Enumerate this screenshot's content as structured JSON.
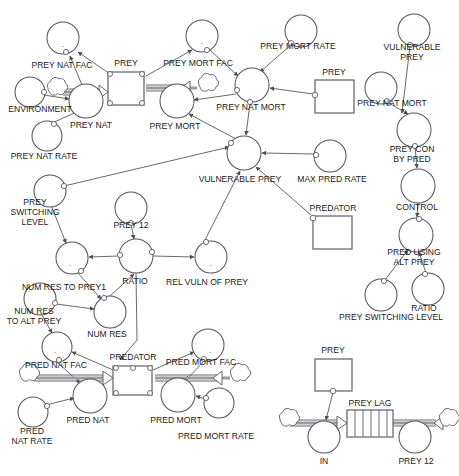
{
  "diagram": {
    "type": "system-dynamics-stock-and-flow",
    "background_color": "#ffffff",
    "line_color": "#55555c",
    "pipe_color": "#9a9aa2",
    "text_color": "#1a1a1a"
  },
  "stocks": [
    {
      "id": "prey",
      "label": "PREY",
      "x": 108,
      "y": 72,
      "w": 36,
      "h": 33
    },
    {
      "id": "prey_ghost",
      "label": "PREY",
      "x": 315,
      "y": 80,
      "w": 39,
      "h": 33
    },
    {
      "id": "predator",
      "label": "PREDATOR",
      "x": 113,
      "y": 366,
      "w": 39,
      "h": 29
    },
    {
      "id": "predator_g",
      "label": "PREDATOR",
      "x": 313,
      "y": 216,
      "w": 39,
      "h": 33
    },
    {
      "id": "prey_low",
      "label": "PREY",
      "x": 315,
      "y": 359,
      "w": 37,
      "h": 32
    }
  ],
  "conveyors": [
    {
      "id": "prey_lag",
      "label": "PREY LAG",
      "x": 347,
      "y": 413,
      "w": 46,
      "h": 27,
      "slats": 5
    }
  ],
  "converters": [
    {
      "id": "prey_nat_fac",
      "label": "PREY NAT FAC",
      "cx": 63,
      "cy": 38,
      "r": 16,
      "sign": "-",
      "label_x": 62,
      "label_y": 66
    },
    {
      "id": "environment",
      "label": "ENVIRONMENT",
      "cx": 30,
      "cy": 92,
      "r": 15,
      "sign": "",
      "label_x": 40,
      "label_y": 110
    },
    {
      "id": "prey_nat",
      "label": "PREY NAT",
      "cx": 86,
      "cy": 101,
      "r": 17,
      "sign": "",
      "label_x": 91,
      "label_y": 126
    },
    {
      "id": "prey_nat_rate",
      "label": "PREY NAT RATE",
      "cx": 47,
      "cy": 136,
      "r": 15,
      "sign": "",
      "label_x": 44,
      "label_y": 157
    },
    {
      "id": "prey_mort_fac",
      "label": "PREY MORT FAC",
      "cx": 202,
      "cy": 36,
      "r": 16,
      "sign": "-",
      "label_x": 198,
      "label_y": 64
    },
    {
      "id": "prey_mort_rate",
      "label": "PREY MORT RATE",
      "cx": 301,
      "cy": 31,
      "r": 16,
      "sign": "",
      "label_x": 298,
      "label_y": 47
    },
    {
      "id": "prey_mort",
      "label": "PREY MORT",
      "cx": 177,
      "cy": 101,
      "r": 17,
      "sign": "",
      "label_x": 175,
      "label_y": 127
    },
    {
      "id": "prey_nat_mort",
      "label": "PREY NAT MORT",
      "cx": 252,
      "cy": 85,
      "r": 17,
      "sign": "",
      "label_x": 251,
      "label_y": 108
    },
    {
      "id": "vulnerable_prey",
      "label": "VULNERABLE PREY",
      "cx": 244,
      "cy": 153,
      "r": 17,
      "sign": "",
      "label_x": 240,
      "label_y": 180
    },
    {
      "id": "max_pred_rate",
      "label": "MAX PRED RATE",
      "cx": 330,
      "cy": 156,
      "r": 16,
      "sign": "",
      "label_x": 332,
      "label_y": 180
    },
    {
      "id": "vulnerable_prey_g",
      "label": "VULNERABLE PREY",
      "cx": 414,
      "cy": 30,
      "r": 16,
      "sign": "",
      "label_x": 410,
      "label_y": 52
    },
    {
      "id": "prey_nat_mort_g",
      "label": "PREY NAT MORT",
      "cx": 381,
      "cy": 88,
      "r": 16,
      "sign": "",
      "label_x": 392,
      "label_y": 104
    },
    {
      "id": "prey_con_by_pred",
      "label": "PREY CON BY PRED",
      "cx": 414,
      "cy": 130,
      "r": 17,
      "sign": "",
      "label_x": 412,
      "label_y": 152
    },
    {
      "id": "control",
      "label": "CONTROL",
      "cx": 418,
      "cy": 186,
      "r": 17,
      "sign": "",
      "label_x": 417,
      "label_y": 208
    },
    {
      "id": "pred_using_alt",
      "label": "PRED USING ALT PREY",
      "cx": 416,
      "cy": 235,
      "r": 17,
      "sign": "",
      "label_x": 414,
      "label_y": 257
    },
    {
      "id": "ratio_r",
      "label": "RATIO",
      "cx": 428,
      "cy": 289,
      "r": 16,
      "sign": "",
      "label_x": 422,
      "label_y": 309
    },
    {
      "id": "prey_switch_r",
      "label": "PREY SWITCHING LEVEL",
      "cx": 381,
      "cy": 295,
      "r": 16,
      "sign": "",
      "label_x": 393,
      "label_y": 318
    },
    {
      "id": "prey_switch_l",
      "label": "PREY SWITCHING LEVEL",
      "cx": 50,
      "cy": 191,
      "r": 16,
      "sign": "",
      "label_x": 35,
      "label_y": 219
    },
    {
      "id": "prey_12",
      "label": "PREY 12",
      "cx": 131,
      "cy": 208,
      "r": 16,
      "sign": "",
      "label_x": 131,
      "label_y": 226
    },
    {
      "id": "ratio_c",
      "label": "RATIO",
      "cx": 136,
      "cy": 256,
      "r": 17,
      "sign": "",
      "label_x": 135,
      "label_y": 282
    },
    {
      "id": "num_res_to_prey1",
      "label": "NUM RES TO PREY1",
      "cx": 72,
      "cy": 258,
      "r": 16,
      "sign": "-",
      "label_x": 64,
      "label_y": 288
    },
    {
      "id": "rel_vuln_of_prey",
      "label": "REL VULN OF PREY",
      "cx": 211,
      "cy": 257,
      "r": 16,
      "sign": "-",
      "label_x": 207,
      "label_y": 283
    },
    {
      "id": "num_res_to_alt",
      "label": "NUM RES TO ALT PREY",
      "cx": 40,
      "cy": 299,
      "r": 16,
      "sign": "-",
      "label_x": 34,
      "label_y": 320
    },
    {
      "id": "num_res",
      "label": "NUM RES",
      "cx": 110,
      "cy": 312,
      "r": 16,
      "sign": "",
      "label_x": 107,
      "label_y": 335
    },
    {
      "id": "pred_nat_fac",
      "label": "PRED NAT FAC",
      "cx": 57,
      "cy": 347,
      "r": 15,
      "sign": "-",
      "label_x": 56,
      "label_y": 366
    },
    {
      "id": "pred_nat",
      "label": "PRED NAT",
      "cx": 90,
      "cy": 396,
      "r": 17,
      "sign": "",
      "label_x": 88,
      "label_y": 421
    },
    {
      "id": "pred_nat_rate",
      "label": "PRED NAT RATE",
      "cx": 33,
      "cy": 412,
      "r": 15,
      "sign": "",
      "label_x": 32,
      "label_y": 437
    },
    {
      "id": "pred_mort_fac",
      "label": "PRED MORT FAC",
      "cx": 208,
      "cy": 345,
      "r": 16,
      "sign": "-",
      "label_x": 200,
      "label_y": 363
    },
    {
      "id": "pred_mort",
      "label": "PRED MORT",
      "cx": 178,
      "cy": 395,
      "r": 17,
      "sign": "",
      "label_x": 176,
      "label_y": 421
    },
    {
      "id": "pred_mort_rate",
      "label": "PRED MORT RATE",
      "cx": 219,
      "cy": 403,
      "r": 15,
      "sign": "",
      "label_x": 215,
      "label_y": 437
    },
    {
      "id": "in_flow",
      "label": "IN",
      "cx": 324,
      "cy": 437,
      "r": 16,
      "sign": "",
      "label_x": 324,
      "label_y": 462
    },
    {
      "id": "prey_12_low",
      "label": "PREY 12",
      "cx": 415,
      "cy": 437,
      "r": 16,
      "sign": "",
      "label_x": 416,
      "label_y": 462
    }
  ],
  "labels": [
    {
      "id": "lbl-prey-top",
      "text": "PREY",
      "x": 126,
      "y": 64
    },
    {
      "id": "lbl-prey-ghost",
      "text": "PREY",
      "x": 334,
      "y": 73
    },
    {
      "id": "lbl-predator-top",
      "text": "PREDATOR",
      "x": 133,
      "y": 358
    },
    {
      "id": "lbl-predator-mid",
      "text": "PREDATOR",
      "x": 333,
      "y": 209
    },
    {
      "id": "lbl-prey-low",
      "text": "PREY",
      "x": 333,
      "y": 351
    },
    {
      "id": "lbl-prey-lag",
      "text": "PREY LAG",
      "x": 370,
      "y": 404
    }
  ],
  "flows": [
    {
      "id": "prey-nat-flow",
      "label": "PREY NAT",
      "from": "cloud",
      "to": "prey"
    },
    {
      "id": "prey-mort-flow",
      "label": "PREY MORT",
      "from": "prey",
      "to": "cloud"
    },
    {
      "id": "pred-nat-flow",
      "label": "PRED NAT",
      "from": "cloud",
      "to": "predator"
    },
    {
      "id": "pred-mort-flow",
      "label": "PRED MORT",
      "from": "predator",
      "to": "cloud"
    },
    {
      "id": "in-flow",
      "label": "IN",
      "from": "cloud",
      "to": "prey_lag"
    },
    {
      "id": "prey12-flow",
      "label": "PREY 12",
      "from": "prey_lag",
      "to": "cloud"
    }
  ],
  "connectors": [
    {
      "from": "prey_nat",
      "to": "prey_nat_fac"
    },
    {
      "from": "prey",
      "to": "prey_nat_fac"
    },
    {
      "from": "environment",
      "to": "prey_nat"
    },
    {
      "from": "prey_nat_rate",
      "to": "prey_nat"
    },
    {
      "from": "prey",
      "to": "prey_mort_fac"
    },
    {
      "from": "prey_mort_fac",
      "to": "prey_nat_mort"
    },
    {
      "from": "prey_mort_rate",
      "to": "prey_nat_mort"
    },
    {
      "from": "prey",
      "to": "prey_nat_mort"
    },
    {
      "from": "prey_nat_mort",
      "to": "prey_mort"
    },
    {
      "from": "prey_nat_mort",
      "to": "vulnerable_prey"
    },
    {
      "from": "vulnerable_prey",
      "to": "prey_mort"
    },
    {
      "from": "max_pred_rate",
      "to": "vulnerable_prey"
    },
    {
      "from": "predator_g",
      "to": "vulnerable_prey"
    },
    {
      "from": "rel_vuln_of_prey",
      "to": "vulnerable_prey"
    },
    {
      "from": "prey_switch_l",
      "to": "vulnerable_prey"
    },
    {
      "from": "ratio_c",
      "to": "rel_vuln_of_prey"
    },
    {
      "from": "ratio_c",
      "to": "num_res_to_prey1"
    },
    {
      "from": "prey_12",
      "to": "ratio_c"
    },
    {
      "from": "num_res",
      "to": "ratio_c"
    },
    {
      "from": "prey_switch_l",
      "to": "num_res_to_prey1"
    },
    {
      "from": "num_res_to_prey1",
      "to": "num_res"
    },
    {
      "from": "num_res_to_alt",
      "to": "num_res"
    },
    {
      "from": "num_res_to_alt",
      "to": "pred_nat_fac"
    },
    {
      "from": "pred_nat_fac",
      "to": "pred_nat"
    },
    {
      "from": "pred_nat_rate",
      "to": "pred_nat"
    },
    {
      "from": "predator",
      "to": "pred_nat_fac"
    },
    {
      "from": "predator",
      "to": "pred_mort_fac"
    },
    {
      "from": "pred_mort_fac",
      "to": "pred_mort"
    },
    {
      "from": "pred_mort_rate",
      "to": "pred_mort"
    },
    {
      "from": "vulnerable_prey_g",
      "to": "prey_con_by_pred"
    },
    {
      "from": "prey_nat_mort_g",
      "to": "prey_con_by_pred"
    },
    {
      "from": "prey_con_by_pred",
      "to": "control"
    },
    {
      "from": "control",
      "to": "pred_using_alt"
    },
    {
      "from": "ratio_r",
      "to": "pred_using_alt"
    },
    {
      "from": "prey_switch_r",
      "to": "pred_using_alt"
    },
    {
      "from": "prey_low",
      "to": "in_flow"
    }
  ]
}
